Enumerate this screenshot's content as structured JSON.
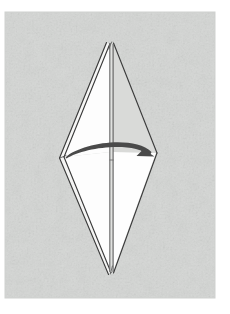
{
  "figure": {
    "kind": "origami-instruction-diagram",
    "canvas": {
      "width": 230,
      "height": 314
    },
    "background": {
      "page_color": "#ffffff",
      "panel_color": "#d6d8d6",
      "panel_texture": "mottled-paper-grain",
      "panel_rect": {
        "x": 5,
        "y": 12,
        "width": 210,
        "height": 286
      }
    },
    "model": {
      "name": "folded-kite-model",
      "fill_front": "#ffffff",
      "fill_shadow": "#d9dad8",
      "line_color": "#3a3a3a",
      "line_color_soft": "#6e6e6e",
      "top_apex": {
        "x": 112,
        "y": 42
      },
      "bottom_apex": {
        "x": 112,
        "y": 274
      },
      "left_vertex": {
        "x": 63,
        "y": 157
      },
      "right_vertex": {
        "x": 157,
        "y": 153
      },
      "center_crease": {
        "x": 112,
        "y_top": 44,
        "y_bottom": 272
      },
      "layer_edges_left": 2,
      "layer_edges_right": 1
    },
    "arrow": {
      "name": "turn-over-arrow",
      "style": "curved-solid-arrow",
      "color": "#4a4a4a",
      "direction": "left-to-right",
      "tail": {
        "x": 66,
        "y": 157
      },
      "apex": {
        "x": 112,
        "y": 143
      },
      "head": {
        "x": 152,
        "y": 155
      },
      "head_length": 14,
      "head_width": 9
    }
  }
}
